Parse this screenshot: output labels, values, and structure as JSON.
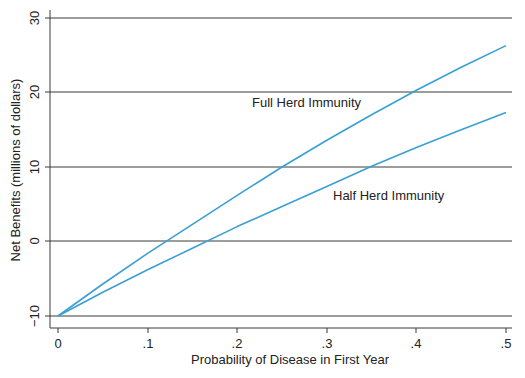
{
  "chart_data": {
    "type": "line",
    "title": "",
    "xlabel": "Probability of Disease in First Year",
    "ylabel": "Net Benefits (millions of dollars)",
    "xlim": [
      0,
      0.5
    ],
    "ylim": [
      -10,
      30
    ],
    "xticks": [
      0,
      0.1,
      0.2,
      0.3,
      0.4,
      0.5
    ],
    "xtick_labels": [
      "0",
      ".1",
      ".2",
      ".3",
      ".4",
      ".5"
    ],
    "yticks": [
      -10,
      0,
      10,
      20,
      30
    ],
    "ytick_labels": [
      "−10",
      "0",
      "10",
      "20",
      "30"
    ],
    "grid": "horizontal",
    "legend": "none (inline annotations)",
    "x": [
      0,
      0.05,
      0.1,
      0.15,
      0.2,
      0.25,
      0.3,
      0.35,
      0.4,
      0.45,
      0.5
    ],
    "series": [
      {
        "name": "Full Herd Immunity",
        "color": "#3a9fd4",
        "values": [
          -10,
          -5.7,
          -1.6,
          2.3,
          6.2,
          10.0,
          13.6,
          17.0,
          20.3,
          23.4,
          26.3
        ]
      },
      {
        "name": "Half Herd Immunity",
        "color": "#3a9fd4",
        "values": [
          -10,
          -6.8,
          -3.8,
          -0.9,
          2.0,
          4.7,
          7.4,
          10.1,
          12.6,
          15.0,
          17.3
        ]
      }
    ],
    "annotations": [
      {
        "text": "Full Herd Immunity",
        "x": 0.235,
        "y": 18.0
      },
      {
        "text": "Half Herd Immunity",
        "x": 0.325,
        "y": 5.5
      }
    ]
  },
  "labels": {
    "xlabel": "Probability of Disease in First Year",
    "ylabel": "Net Benefits (millions of dollars)",
    "full": "Full Herd Immunity",
    "half": "Half Herd Immunity",
    "x0": "0",
    "x1": ".1",
    "x2": ".2",
    "x3": ".3",
    "x4": ".4",
    "x5": ".5",
    "y0": "−10",
    "y1": "0",
    "y2": "10",
    "y3": "20",
    "y4": "30"
  },
  "colors": {
    "line": "#3a9fd4",
    "grid": "#333333"
  },
  "caption": "Figure 10.4 Net benefits of vaccination program"
}
